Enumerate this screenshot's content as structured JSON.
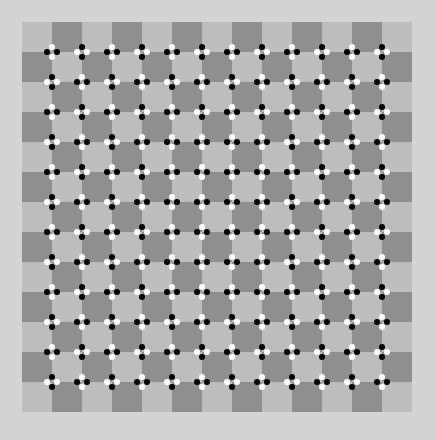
{
  "illusion": {
    "name": "checkerboard-bulge-illusion",
    "grid_size": 13,
    "cell_px": 30,
    "origin": [
      22,
      22
    ],
    "colors": {
      "background": "#d3d3d3",
      "light_cell": "#bdbdbd",
      "dark_cell": "#8f8f8f",
      "dot_black": "#000000",
      "dot_white": "#ffffff"
    },
    "first_cell": "light",
    "cluster_types": {
      "H": [
        "w",
        "b",
        "w",
        "b"
      ],
      "V": [
        "b",
        "w",
        "b",
        "w"
      ]
    },
    "clusters": [
      "HVHVHVHVHVHV",
      "VHVHVHVHVHVH",
      "HVHVHVHVHVHV",
      "VHVHHHHHVHVH",
      "HVHVHHHHHVHV",
      "VHVHHHHHVHVH",
      "HVHVHHHHHVHV",
      "VHVHHHHHVHVH",
      "HVHVHHHHHVHV",
      "VHVHVHVHVHVH",
      "HVHVHVHVHVHV",
      "VHVHVHVHVHVH"
    ]
  }
}
